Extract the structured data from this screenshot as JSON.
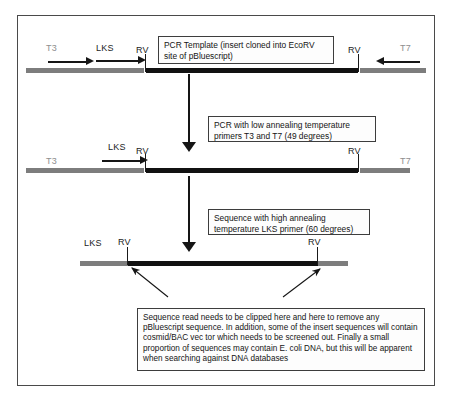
{
  "diagram": {
    "colors": {
      "vector_strand": "#7d7d7d",
      "insert_strand": "#111111",
      "line": "#151515",
      "box_border": "#3d3d3d",
      "frame_border": "#4a4a4a",
      "faint_label": "#8e8e8e"
    },
    "stages": [
      {
        "id": "stage-1",
        "name": "pcr-template",
        "labels": {
          "t3": "T3",
          "lks": "LKS",
          "rv_left": "RV",
          "rv_right": "RV",
          "t7": "T7"
        },
        "callout": "PCR Template (insert cloned into EcoRV site of pBluescript)",
        "primers": [
          {
            "name": "t3-primer-arrow",
            "direction": "right"
          },
          {
            "name": "lks-primer-arrow",
            "direction": "right"
          },
          {
            "name": "t7-primer-arrow",
            "direction": "left"
          }
        ]
      },
      {
        "id": "stage-2",
        "name": "pcr-product",
        "labels": {
          "t3": "T3",
          "lks": "LKS",
          "rv_left": "RV",
          "rv_right": "RV",
          "t7": "T7"
        },
        "primers": [
          {
            "name": "lks-primer-arrow",
            "direction": "right"
          }
        ]
      },
      {
        "id": "stage-3",
        "name": "sequence-read",
        "labels": {
          "lks": "LKS",
          "rv_left": "RV",
          "rv_right": "RV"
        }
      }
    ],
    "steps": [
      {
        "id": "step-pcr",
        "name": "pcr-step",
        "text": "PCR with low annealing temperature primers T3 and T7 (49 degrees)"
      },
      {
        "id": "step-sequence",
        "name": "sequencing-step",
        "text": "Sequence with high annealing temperature LKS primer (60 degrees)"
      }
    ],
    "note": "Sequence read needs to be clipped here and here to remove any pBluescript sequence. In addition, some of the insert sequences will contain cosmid/BAC vec tor which needs to be screened out. Finally a small proportion of sequences may contain E. coli DNA, but this will be apparent when searching against DNA databases"
  }
}
